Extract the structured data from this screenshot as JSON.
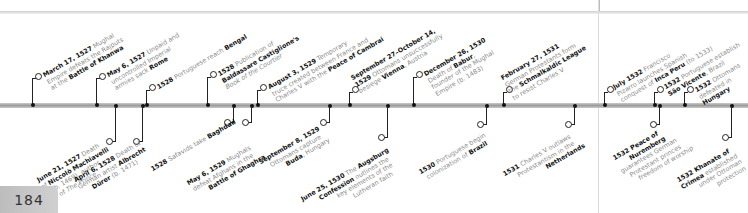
{
  "page": {
    "number": "184"
  },
  "colors": {
    "bar": "#a8a8a8",
    "text_bold": "#111111",
    "text_light": "#8a8a8a",
    "page_box": "#c6c6c6"
  },
  "events_above": [
    {
      "date": "March 17, 1527",
      "lines": [
        "Mughal",
        "Empire defeats the Rajputs",
        "at the"
      ],
      "highlight": "Battle of Khanwa"
    },
    {
      "date": "May 6, 1527",
      "lines": [
        "Unpaid and",
        "uncontrolled Imperial",
        "armies sack"
      ],
      "highlight": "Rome"
    },
    {
      "date": "1528",
      "lines": [
        "Portuguese reach"
      ],
      "highlight": "Bengal"
    },
    {
      "date": "1528",
      "lines": [
        "Publication of"
      ],
      "highlight": "Baldassare Castiglione's",
      "italic": "Book of the Courtier"
    },
    {
      "date": "August 3, 1529",
      "lines": [
        "Temporary",
        "truce created between France and",
        "Charles V with the"
      ],
      "highlight": "Peace of Cambrai"
    },
    {
      "date": "September 27–October 14, 1529",
      "lines": [
        "Ottomans unsuccessfully",
        "besiege"
      ],
      "highlight": "Vienna",
      "tail": ", Austria"
    },
    {
      "date": "December 26, 1530",
      "lines": [
        "Death of"
      ],
      "highlight": "Babur",
      "tail_lines": [
        ", founder of the Mughal",
        "Empire (b. 1483)"
      ]
    },
    {
      "date": "February 27, 1531",
      "lines": [
        "German Protestants form",
        "the"
      ],
      "highlight": "Schmalkaldic League",
      "tail": "to resist Charles V"
    },
    {
      "date": "July 1532",
      "lines": [
        "Francisco",
        "Pizarro launches Spanish",
        "conquest of"
      ],
      "highlight": "Inca Peru",
      "tail": "(to 1533)"
    },
    {
      "date": "1532",
      "lines": [
        "Portuguese establish"
      ],
      "highlight": "São Vicente",
      "tail": ", Brazil"
    },
    {
      "date": "1532",
      "lines": [
        "Ottomans",
        "defeated in"
      ],
      "highlight": "Hungary"
    }
  ],
  "events_below": [
    {
      "date": "June 21, 1527",
      "lines": [
        "Death",
        "of"
      ],
      "highlight": "Niccolò Machiavelli",
      "tail_lines": [
        "(b. 1469), author",
        "of The Prince"
      ]
    },
    {
      "date": "April 6, 1528",
      "lines": [
        "Death of",
        "German artist"
      ],
      "highlight": "Albrecht Dürer",
      "tail": "(b. 1471)"
    },
    {
      "date": "1528",
      "lines": [
        "Safavids take"
      ],
      "highlight": "Baghdad"
    },
    {
      "date": "May 6, 1529",
      "lines": [
        "Mughals",
        "defeat Afghans in the"
      ],
      "highlight": "Battle of Ghaghra"
    },
    {
      "date": "September 8, 1529",
      "lines": [
        "Ottomans capture"
      ],
      "highlight": "Buda",
      "tail": ", Hungary"
    },
    {
      "date": "June 25, 1530",
      "lines": [
        "The"
      ],
      "highlight": "Augsburg Confession",
      "tail_lines": [
        "outlines the",
        "key elements of the",
        "Lutheran faith"
      ]
    },
    {
      "date": "1530",
      "lines": [
        "Portuguese begin",
        "colonization of"
      ],
      "highlight": "Brazil"
    },
    {
      "date": "1531",
      "lines": [
        "Charles V outlaws",
        "Protestantism in the"
      ],
      "highlight": "Netherlands"
    },
    {
      "date": "1532",
      "lines": [],
      "highlight": "Peace of Nuremberg",
      "tail_lines": [
        "guarantees German",
        "Protestant princes",
        "freedom of worship"
      ]
    },
    {
      "date": "1532",
      "lines": [],
      "highlight": "Khanate of Crimea",
      "tail_lines": [
        "established",
        "under Ottoman",
        "protection"
      ]
    }
  ],
  "text": {
    "a0": "March 17, 1527",
    "a0b": " Mughal",
    "a0c": "Empire defeats the Rajputs",
    "a0d": "at the ",
    "a0e": "Battle of Khanwa",
    "a1": "May 6, 1527",
    "a1b": " Unpaid and",
    "a1c": "uncontrolled Imperial",
    "a1d": "armies sack ",
    "a1e": "Rome",
    "a2": "1528",
    "a2b": " Portuguese reach ",
    "a2e": "Bengal",
    "a3": "1528",
    "a3b": " Publication of",
    "a3e": "Baldassare Castiglione's",
    "a3f": "Book of the Courtier",
    "a4": "August 3, 1529",
    "a4b": " Temporary",
    "a4c": "truce created between France and",
    "a4d": "Charles V with the ",
    "a4e": "Peace of Cambrai",
    "a5": "September 27–October 14,",
    "a5a": "1529",
    "a5b": " Ottomans unsuccessfully",
    "a5c": "besiege ",
    "a5e": "Vienna",
    "a5f": ", Austria",
    "a6": "December 26, 1530",
    "a6b": "Death of ",
    "a6e": "Babur",
    "a6f": ",",
    "a6c": "founder of the Mughal",
    "a6d": "Empire (b. 1483)",
    "a7": "February 27, 1531",
    "a7b": "German Protestants form",
    "a7c": "the ",
    "a7e": "Schmalkaldic League",
    "a7d": "to resist Charles V",
    "a8": "July 1532",
    "a8b": " Francisco",
    "a8c": "Pizarro launches Spanish",
    "a8d": "conquest of ",
    "a8e": "Inca Peru",
    "a8f": " (to 1533)",
    "a9": "1532",
    "a9b": " Portuguese establish",
    "a9e": "São Vicente",
    "a9f": ", Brazil",
    "a10": "1532",
    "a10b": " Ottomans",
    "a10c": "defeated in",
    "a10e": "Hungary",
    "b0": "June 21, 1527",
    "b0b": " Death",
    "b0c": "of ",
    "b0e": "Niccolò Machiavelli",
    "b0d": "(b. 1469), author",
    "b0f": "of ",
    "b0g": "The Prince",
    "b1": "April 6, 1528",
    "b1b": " Death of",
    "b1c": "German artist ",
    "b1e": "Albrecht",
    "b1f": "Dürer",
    "b1g": " (b. 1471)",
    "b2": "1528",
    "b2b": " Safavids take ",
    "b2e": "Baghdad",
    "b3": "May 6, 1529",
    "b3b": " Mughals",
    "b3c": "defeat Afghans in the",
    "b3e": "Battle of Ghaghra",
    "b4": "September 8, 1529",
    "b4b": "Ottomans capture",
    "b4e": "Buda",
    "b4f": ", Hungary",
    "b5": "June 25, 1530",
    "b5b": " The ",
    "b5e": "Augsburg",
    "b5f": "Confession",
    "b5g": " outlines the",
    "b5c": "key elements of the",
    "b5d": "Lutheran faith",
    "b6": "1530",
    "b6b": " Portuguese begin",
    "b6c": "colonization of ",
    "b6e": "Brazil",
    "b7": "1531",
    "b7b": " Charles V outlaws",
    "b7c": "Protestantism in the",
    "b7e": "Netherlands",
    "b8": "1532 Peace of",
    "b8e": "Nuremberg",
    "b8c": "guarantees German",
    "b8d": "Protestant princes",
    "b8f": "freedom of worship",
    "b9": "1532 Khanate of",
    "b9e": "Crimea",
    "b9b": " established",
    "b9c": "under Ottoman",
    "b9d": "protection"
  }
}
